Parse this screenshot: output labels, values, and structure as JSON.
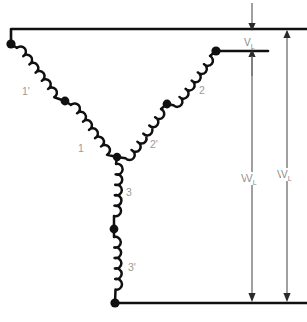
{
  "diagram": {
    "type": "electrical-schematic",
    "background_color": "#ffffff",
    "wire_color": "#101010",
    "dimension_color": "#6e6e6e",
    "label_color": "#9a9a9a",
    "coil_labels": [
      {
        "id": "coil-label-1-prime",
        "text": "1'",
        "x": 22,
        "y": 95,
        "branch": "left",
        "position": "outer"
      },
      {
        "id": "coil-label-1",
        "text": "1",
        "x": 78,
        "y": 152,
        "branch": "left",
        "position": "inner"
      },
      {
        "id": "coil-label-2",
        "text": "2",
        "x": 199,
        "y": 94,
        "branch": "right",
        "position": "outer"
      },
      {
        "id": "coil-label-2-prime",
        "text": "2'",
        "x": 150,
        "y": 148,
        "branch": "right",
        "position": "inner"
      },
      {
        "id": "coil-label-3",
        "text": "3",
        "x": 126,
        "y": 196,
        "branch": "bottom",
        "position": "inner"
      },
      {
        "id": "coil-label-3-prime",
        "text": "3'",
        "x": 128,
        "y": 271,
        "branch": "bottom",
        "position": "outer"
      }
    ],
    "dimension_labels": [
      {
        "id": "vl-top",
        "text": "V",
        "subscript": "L",
        "x": 248,
        "y": 46,
        "orientation": "horizontal"
      },
      {
        "id": "vl-middle",
        "text": "V",
        "subscript": "L",
        "x": 245,
        "y": 182,
        "orientation": "horizontal"
      },
      {
        "id": "vl-right",
        "text": "V",
        "subscript": "L",
        "x": 281,
        "y": 178,
        "orientation": "horizontal"
      }
    ],
    "terminals": [
      {
        "id": "terminal-1",
        "label": "",
        "x": 11,
        "y": 44
      },
      {
        "id": "terminal-2",
        "label": "",
        "x": 216,
        "y": 51
      },
      {
        "id": "terminal-3",
        "label": "",
        "x": 115,
        "y": 303
      }
    ],
    "tap_nodes": [
      {
        "id": "tap-left",
        "x": 65,
        "y": 101
      },
      {
        "id": "tap-right",
        "x": 167,
        "y": 104
      },
      {
        "id": "tap-bottom",
        "x": 114,
        "y": 229
      }
    ],
    "neutral_node": {
      "id": "neutral-junction",
      "x": 117,
      "y": 157
    },
    "measurements": [
      {
        "name": "line-voltage-top",
        "value": "V_L",
        "span": "between top bus and second bus"
      },
      {
        "name": "line-voltage-middle",
        "value": "V_L",
        "span": "between second bus and bottom bus"
      },
      {
        "name": "line-voltage-right",
        "value": "V_L",
        "span": "between top bus and bottom bus"
      }
    ]
  }
}
